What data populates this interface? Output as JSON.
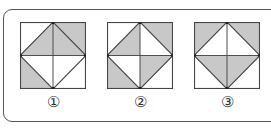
{
  "colors": {
    "shade": "#c8c8c8",
    "blank": "#ffffff",
    "line": "#444444"
  },
  "figures": [
    {
      "label": "①",
      "regions": {
        "corner_top_left": false,
        "corner_top_right": true,
        "corner_bottom_left": true,
        "corner_bottom_right": false,
        "inner_top_left": true,
        "inner_top_right": true,
        "inner_bottom_left": false,
        "inner_bottom_right": false
      }
    },
    {
      "label": "②",
      "regions": {
        "corner_top_left": false,
        "corner_top_right": true,
        "corner_bottom_left": true,
        "corner_bottom_right": false,
        "inner_top_left": true,
        "inner_top_right": false,
        "inner_bottom_left": false,
        "inner_bottom_right": true
      }
    },
    {
      "label": "③",
      "regions": {
        "corner_top_left": true,
        "corner_top_right": true,
        "corner_bottom_left": false,
        "corner_bottom_right": false,
        "inner_top_left": false,
        "inner_top_right": false,
        "inner_bottom_left": true,
        "inner_bottom_right": true
      }
    }
  ]
}
